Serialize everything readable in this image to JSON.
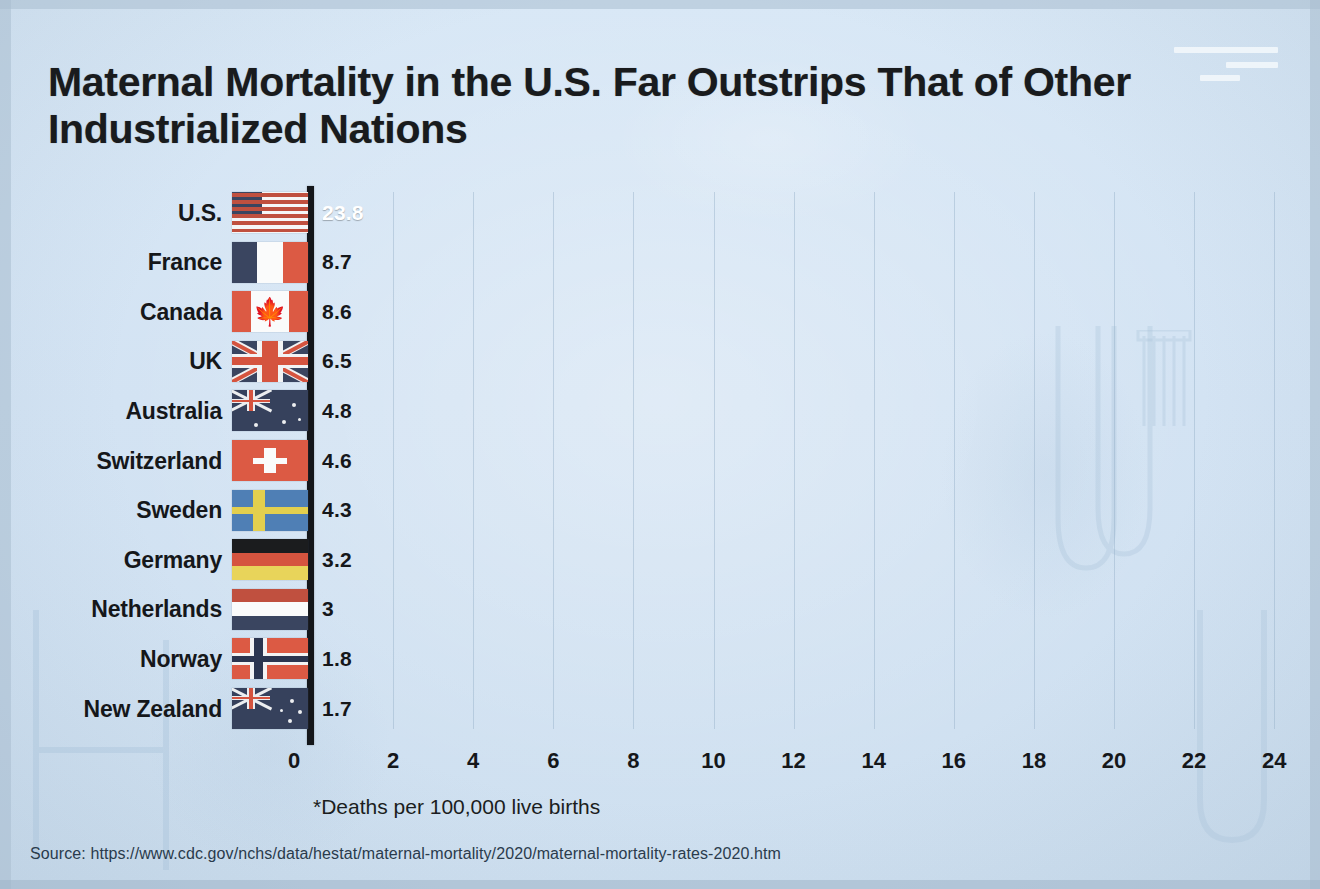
{
  "title": "Maternal Mortality in the U.S. Far Outstrips That of Other Industrialized Nations",
  "logo": "three-bars-logo",
  "footnote": "*Deaths per 100,000 live births",
  "source": "Source: https://www.cdc.gov/nchs/data/hestat/maternal-mortality/2020/maternal-mortality-rates-2020.htm",
  "colors": {
    "background": "#d9e8f6",
    "highlight_bar": "#9d5345",
    "bar": "#fbfdfe",
    "text": "#15171a",
    "axis": "#14161a",
    "gridline": "#94afc8"
  },
  "chart_data": {
    "type": "bar",
    "orientation": "horizontal",
    "title": "Maternal Mortality in the U.S. Far Outstrips That of Other Industrialized Nations",
    "xlabel": "*Deaths per 100,000 live births",
    "ylabel": "",
    "xlim": [
      0,
      24.8
    ],
    "xticks": [
      0,
      2,
      4,
      6,
      8,
      10,
      12,
      14,
      16,
      18,
      20,
      22,
      24
    ],
    "grid": true,
    "legend": false,
    "categories": [
      "U.S.",
      "France",
      "Canada",
      "UK",
      "Australia",
      "Switzerland",
      "Sweden",
      "Germany",
      "Netherlands",
      "Norway",
      "New Zealand"
    ],
    "values": [
      23.8,
      8.7,
      8.6,
      6.5,
      4.8,
      4.6,
      4.3,
      3.2,
      3,
      1.8,
      1.7
    ],
    "value_labels": [
      "23.8",
      "8.7",
      "8.6",
      "6.5",
      "4.8",
      "4.6",
      "4.3",
      "3.2",
      "3",
      "1.8",
      "1.7"
    ],
    "highlighted": "U.S.",
    "rows": [
      {
        "country": "U.S.",
        "flag": "flag-united-states",
        "value": 23.8,
        "label": "23.8",
        "highlight": true
      },
      {
        "country": "France",
        "flag": "flag-france",
        "value": 8.7,
        "label": "8.7",
        "highlight": false
      },
      {
        "country": "Canada",
        "flag": "flag-canada",
        "value": 8.6,
        "label": "8.6",
        "highlight": false
      },
      {
        "country": "UK",
        "flag": "flag-united-kingdom",
        "value": 6.5,
        "label": "6.5",
        "highlight": false
      },
      {
        "country": "Australia",
        "flag": "flag-australia",
        "value": 4.8,
        "label": "4.8",
        "highlight": false
      },
      {
        "country": "Switzerland",
        "flag": "flag-switzerland",
        "value": 4.6,
        "label": "4.6",
        "highlight": false
      },
      {
        "country": "Sweden",
        "flag": "flag-sweden",
        "value": 4.3,
        "label": "4.3",
        "highlight": false
      },
      {
        "country": "Germany",
        "flag": "flag-germany",
        "value": 3.2,
        "label": "3.2",
        "highlight": false
      },
      {
        "country": "Netherlands",
        "flag": "flag-netherlands",
        "value": 3,
        "label": "3",
        "highlight": false
      },
      {
        "country": "Norway",
        "flag": "flag-norway",
        "value": 1.8,
        "label": "1.8",
        "highlight": false
      },
      {
        "country": "New Zealand",
        "flag": "flag-new-zealand",
        "value": 1.7,
        "label": "1.7",
        "highlight": false
      }
    ]
  }
}
